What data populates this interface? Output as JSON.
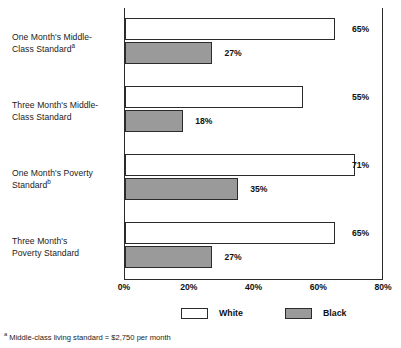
{
  "chart_data": {
    "type": "bar",
    "orientation": "horizontal",
    "title": "",
    "xlabel": "",
    "ylabel": "",
    "xlim": [
      0,
      80
    ],
    "grid": false,
    "legend_position": "bottom",
    "categories": [
      "One Month's Middle-Class Standard",
      "Three Month's Middle-Class Standard",
      "One Month's Poverty Standard",
      "Three Month's Poverty Standard"
    ],
    "category_labels": [
      {
        "line1": "One Month's Middle-",
        "line2": "Class Standard",
        "footnote_marker": "a"
      },
      {
        "line1": "Three Month's Middle-",
        "line2": "Class Standard",
        "footnote_marker": ""
      },
      {
        "line1": "One Month's Poverty",
        "line2": "Standard",
        "footnote_marker": "b"
      },
      {
        "line1": "Three Month's",
        "line2": "Poverty Standard",
        "footnote_marker": ""
      }
    ],
    "series": [
      {
        "name": "White",
        "color": "#ffffff",
        "values": [
          65,
          55,
          71,
          65
        ],
        "value_labels": [
          "65%",
          "55%",
          "71%",
          "65%"
        ]
      },
      {
        "name": "Black",
        "color": "#9a9a9a",
        "values": [
          27,
          18,
          35,
          27
        ],
        "value_labels": [
          "27%",
          "18%",
          "35%",
          "27%"
        ]
      }
    ],
    "xticks": [
      0,
      20,
      40,
      60,
      80
    ],
    "xtick_labels": [
      "0%",
      "20%",
      "40%",
      "60%",
      "80%"
    ],
    "legend": [
      {
        "label": "White",
        "color": "#ffffff"
      },
      {
        "label": "Black",
        "color": "#9a9a9a"
      }
    ],
    "footnote": {
      "marker": "a",
      "text": "Middle-class living standard = $2,750 per month"
    }
  }
}
